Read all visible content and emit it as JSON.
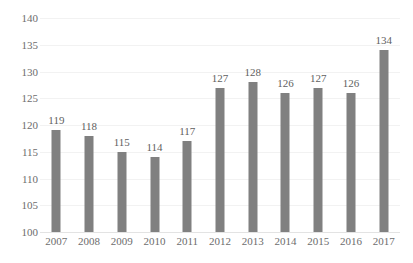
{
  "chart_data": {
    "type": "bar",
    "title": "",
    "subtitle": "",
    "xlabel": "",
    "ylabel": "",
    "categories": [
      "2007",
      "2008",
      "2009",
      "2010",
      "2011",
      "2012",
      "2013",
      "2014",
      "2015",
      "2016",
      "2017"
    ],
    "values": [
      119,
      118,
      115,
      114,
      117,
      127,
      128,
      126,
      127,
      126,
      134
    ],
    "data_labels": [
      "119",
      "118",
      "115",
      "114",
      "117",
      "127",
      "128",
      "126",
      "127",
      "126",
      "134"
    ],
    "ylim": [
      100,
      140
    ],
    "ytick_values": [
      100,
      105,
      110,
      115,
      120,
      125,
      130,
      135,
      140
    ],
    "ytick_labels": [
      "100",
      "105",
      "110",
      "115",
      "120",
      "125",
      "130",
      "135",
      "140"
    ],
    "grid": true,
    "grid_orientation": "horizontal",
    "legend": false,
    "legend_position": "none",
    "annotations": [],
    "series": [
      {
        "name": "",
        "values": [
          119,
          118,
          115,
          114,
          117,
          127,
          128,
          126,
          127,
          126,
          134
        ]
      }
    ]
  },
  "style": {
    "bar_color": "#808080",
    "gridline_color": "#f2f2f2",
    "baseline_color": "#e3e3e3",
    "tick_text_color": "#6d6d6d",
    "label_text_color": "#5f5f5f",
    "background_color": "#ffffff"
  }
}
